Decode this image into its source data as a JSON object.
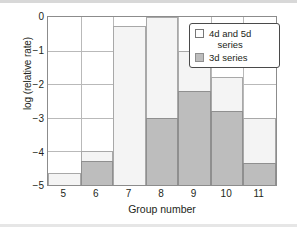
{
  "chart_data": {
    "type": "bar",
    "title": "",
    "xlabel": "Group number",
    "ylabel": "log (relative rate)",
    "categories": [
      "5",
      "6",
      "7",
      "8",
      "9",
      "10",
      "11"
    ],
    "xtick_labels": [
      "5",
      "6",
      "7",
      "8",
      "9",
      "10",
      "11"
    ],
    "ytick_labels": [
      "0",
      "−1",
      "−2",
      "−3",
      "−4",
      "−5"
    ],
    "ylim": [
      -5,
      0
    ],
    "xlim": [
      4.5,
      11.5
    ],
    "grid": true,
    "stacked": true,
    "baseline": -5,
    "legend_position": "top-right",
    "series": [
      {
        "name": "4d and 5d series",
        "swatch": "light",
        "color": "#f4f4f4",
        "tops": [
          -4.65,
          -4.0,
          -0.27,
          0.0,
          -1.0,
          -1.8,
          -3.0
        ]
      },
      {
        "name": "3d series",
        "swatch": "dark",
        "color": "#bdbdbd",
        "tops": [
          -5.0,
          -4.3,
          -5.0,
          -3.0,
          -2.2,
          -2.8,
          -4.35
        ]
      }
    ]
  },
  "legend": {
    "entries": [
      {
        "label_line1": "4d and 5d",
        "label_line2": "series",
        "swatch": "light"
      },
      {
        "label_line1": "3d series",
        "label_line2": "",
        "swatch": "dark"
      }
    ]
  },
  "colors": {
    "light_series": "#f4f4f4",
    "dark_series": "#bdbdbd",
    "grid": "#b9b9b9",
    "frame": "#8c8c8c",
    "text": "#231f20"
  }
}
